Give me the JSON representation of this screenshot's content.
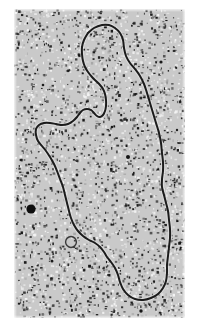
{
  "image": {
    "kind": "electron-micrograph",
    "subject": "circular DNA molecule (plasmid) contour",
    "width_px": 199,
    "height_px": 325,
    "background_color": "#ffffff"
  },
  "micrograph": {
    "frame": {
      "x": 14,
      "y": 9,
      "width": 171,
      "height": 309
    },
    "field_color": "#c9c9c9",
    "grain_dark_color": "#151515",
    "grain_light_color": "#f4f4f4",
    "grain_density": 3400,
    "grain_seed": 20240517,
    "contour_color": "#1b1b1b",
    "contour_width_px": 2.0,
    "contour_closed": true,
    "contour_points": [
      [
        74,
        24
      ],
      [
        80,
        19
      ],
      [
        88,
        16
      ],
      [
        95,
        16
      ],
      [
        101,
        19
      ],
      [
        106,
        24
      ],
      [
        109,
        31
      ],
      [
        110,
        39
      ],
      [
        112,
        47
      ],
      [
        116,
        54
      ],
      [
        121,
        60
      ],
      [
        126,
        67
      ],
      [
        130,
        75
      ],
      [
        133,
        84
      ],
      [
        136,
        94
      ],
      [
        139,
        104
      ],
      [
        142,
        114
      ],
      [
        145,
        124
      ],
      [
        147,
        134
      ],
      [
        148,
        144
      ],
      [
        149,
        153
      ],
      [
        149,
        162
      ],
      [
        148,
        170
      ],
      [
        148,
        178
      ],
      [
        150,
        186
      ],
      [
        152,
        194
      ],
      [
        154,
        202
      ],
      [
        155,
        211
      ],
      [
        156,
        220
      ],
      [
        156,
        229
      ],
      [
        155,
        238
      ],
      [
        154,
        247
      ],
      [
        153,
        256
      ],
      [
        153,
        264
      ],
      [
        152,
        272
      ],
      [
        149,
        279
      ],
      [
        144,
        285
      ],
      [
        137,
        289
      ],
      [
        129,
        291
      ],
      [
        121,
        290
      ],
      [
        114,
        286
      ],
      [
        109,
        280
      ],
      [
        106,
        273
      ],
      [
        104,
        266
      ],
      [
        101,
        259
      ],
      [
        97,
        253
      ],
      [
        93,
        248
      ],
      [
        90,
        243
      ],
      [
        86,
        238
      ],
      [
        81,
        234
      ],
      [
        75,
        231
      ],
      [
        69,
        227
      ],
      [
        64,
        222
      ],
      [
        60,
        216
      ],
      [
        57,
        209
      ],
      [
        55,
        202
      ],
      [
        53,
        194
      ],
      [
        51,
        186
      ],
      [
        49,
        178
      ],
      [
        46,
        170
      ],
      [
        43,
        162
      ],
      [
        40,
        155
      ],
      [
        36,
        148
      ],
      [
        32,
        142
      ],
      [
        28,
        137
      ],
      [
        24,
        132
      ],
      [
        22,
        126
      ],
      [
        22,
        120
      ],
      [
        25,
        116
      ],
      [
        30,
        114
      ],
      [
        36,
        114
      ],
      [
        42,
        115
      ],
      [
        48,
        116
      ],
      [
        54,
        115
      ],
      [
        59,
        112
      ],
      [
        63,
        108
      ],
      [
        66,
        104
      ],
      [
        69,
        101
      ],
      [
        73,
        100
      ],
      [
        77,
        101
      ],
      [
        80,
        104
      ],
      [
        83,
        107
      ],
      [
        86,
        108
      ],
      [
        89,
        106
      ],
      [
        91,
        102
      ],
      [
        92,
        97
      ],
      [
        92,
        91
      ],
      [
        91,
        85
      ],
      [
        89,
        80
      ],
      [
        86,
        76
      ],
      [
        82,
        72
      ],
      [
        78,
        68
      ],
      [
        74,
        63
      ],
      [
        71,
        58
      ],
      [
        69,
        52
      ],
      [
        68,
        45
      ],
      [
        68,
        38
      ],
      [
        70,
        31
      ],
      [
        74,
        24
      ]
    ],
    "inner_curl": {
      "present": true,
      "color": "#3a3a3a",
      "points": [
        [
          52,
          231
        ],
        [
          55,
          228
        ],
        [
          59,
          228
        ],
        [
          62,
          231
        ],
        [
          62,
          235
        ],
        [
          59,
          238
        ],
        [
          55,
          238
        ],
        [
          52,
          235
        ]
      ]
    },
    "stain_particles": [
      {
        "cx": 17,
        "cy": 200,
        "r": 4.6,
        "color": "#0e0e0e"
      },
      {
        "cx": 114,
        "cy": 148,
        "r": 2.0,
        "color": "#141414"
      },
      {
        "cx": 147,
        "cy": 53,
        "r": 1.6,
        "color": "#191919"
      },
      {
        "cx": 38,
        "cy": 252,
        "r": 1.5,
        "color": "#191919"
      },
      {
        "cx": 127,
        "cy": 302,
        "r": 1.7,
        "color": "#161616"
      },
      {
        "cx": 63,
        "cy": 166,
        "r": 1.4,
        "color": "#1c1c1c"
      },
      {
        "cx": 98,
        "cy": 118,
        "r": 1.3,
        "color": "#1c1c1c"
      },
      {
        "cx": 157,
        "cy": 232,
        "r": 1.4,
        "color": "#1a1a1a"
      },
      {
        "cx": 29,
        "cy": 76,
        "r": 1.3,
        "color": "#1d1d1d"
      },
      {
        "cx": 163,
        "cy": 121,
        "r": 1.2,
        "color": "#1d1d1d"
      }
    ]
  }
}
